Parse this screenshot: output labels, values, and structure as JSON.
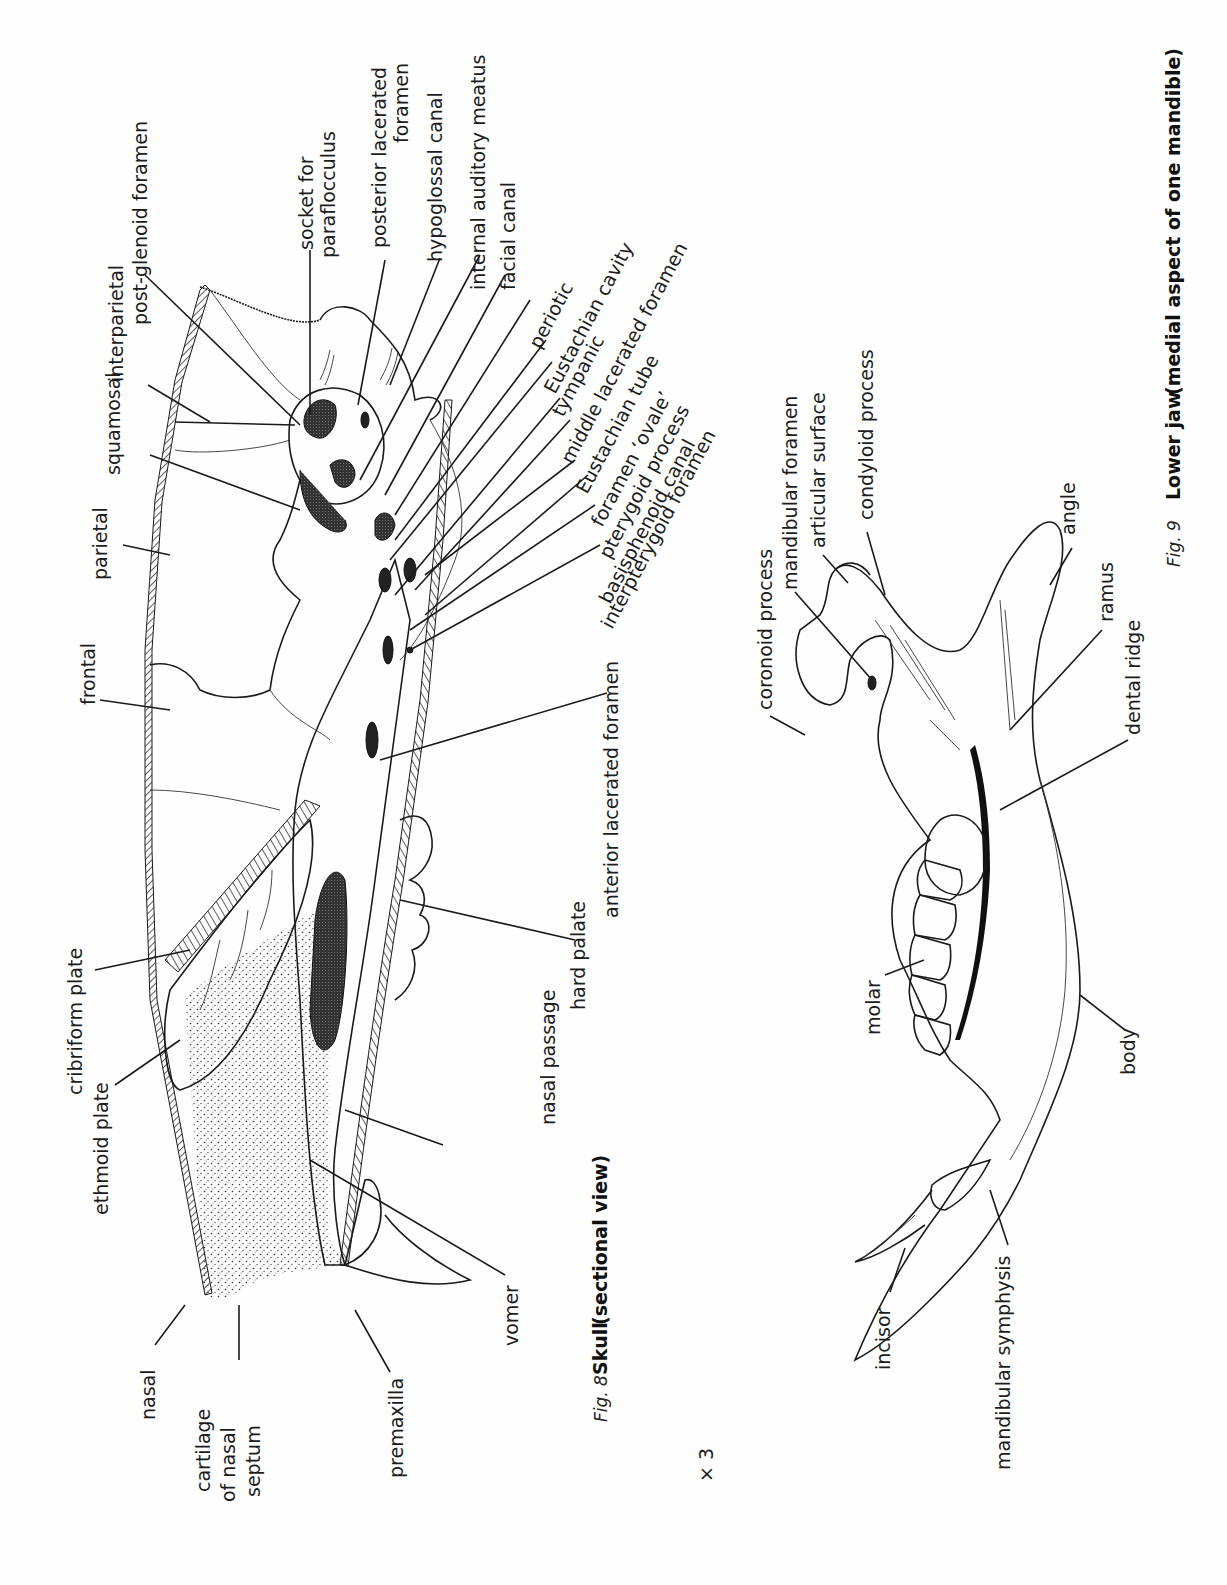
{
  "page": {
    "scale_mark": "× 3"
  },
  "figure8": {
    "fig_label": "Fig. 8",
    "title": "Skull",
    "subtitle": "(sectional view)",
    "labels": {
      "socket_for": "socket for",
      "paraflocculus": "paraflocculus",
      "posterior_lacerated": "posterior lacerated",
      "foramen_1": "foramen",
      "hypoglossal_canal": "hypoglossal canal",
      "internal_auditory_meatus": "internal auditory meatus",
      "facial_canal": "facial canal",
      "periotic": "periotic",
      "eustachian_cavity": "Eustachian cavity",
      "tympanic": "tympanic",
      "middle_lacerated_foramen": "middle lacerated foramen",
      "eustachian_tube": "Eustachian tube",
      "foramen_ovale": "foramen ‘ovale’",
      "pterygoid_process": "pterygoid process",
      "basisphenoid_canal": "basisphenoid canal",
      "interpterygoid_foramen": "interpterygoid foramen",
      "interparietal": "interparietal",
      "post_glenoid_foramen": "post-glenoid foramen",
      "squamosal": "squamosal",
      "parietal": "parietal",
      "frontal": "frontal",
      "anterior_lacerated_foramen": "anterior lacerated foramen",
      "hard_palate": "hard palate",
      "nasal_passage": "nasal passage",
      "cribriform_plate": "cribriform plate",
      "ethmoid_plate": "ethmoid plate",
      "nasal": "nasal",
      "cartilage": "cartilage",
      "of_nasal": "of nasal",
      "septum": "septum",
      "premaxilla": "premaxilla",
      "vomer": "vomer"
    }
  },
  "figure9": {
    "fig_label": "Fig. 9",
    "title": "Lower jaw",
    "subtitle": "(medial aspect of one mandible)",
    "labels": {
      "coronoid_process": "coronoid process",
      "mandibular_foramen": "mandibular foramen",
      "articular_surface": "articular surface",
      "condyloid_process": "condyloid process",
      "angle": "angle",
      "ramus": "ramus",
      "dental_ridge": "dental ridge",
      "molar": "molar",
      "body": "body",
      "incisor": "incisor",
      "mandibular_symphysis": "mandibular symphysis"
    }
  },
  "colors": {
    "ink": "#1a1a1a",
    "paper": "#fefefe"
  }
}
